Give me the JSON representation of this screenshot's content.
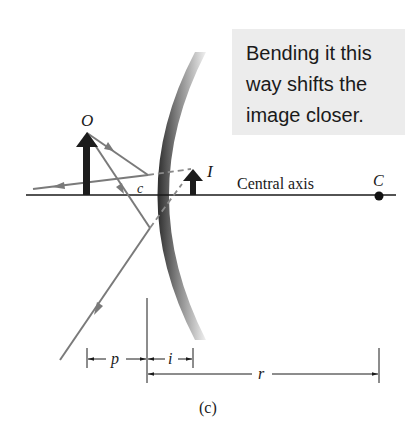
{
  "callout": {
    "lines": [
      "Bending it this",
      "way shifts the",
      "image closer."
    ],
    "background": "#ececec"
  },
  "labels": {
    "object": "O",
    "image": "I",
    "center_of_curvature": "C",
    "mirror_center": "c",
    "central_axis": "Central axis",
    "object_distance": "p",
    "image_distance": "i",
    "radius": "r",
    "figure_part": "(c)"
  },
  "colors": {
    "ray": "#7a7a7a",
    "axis": "#1a1a1a",
    "arrow_fill": "#1c1c1c",
    "mirror_dark": "#3a3a3a",
    "mirror_light": "#e8e8e8"
  }
}
